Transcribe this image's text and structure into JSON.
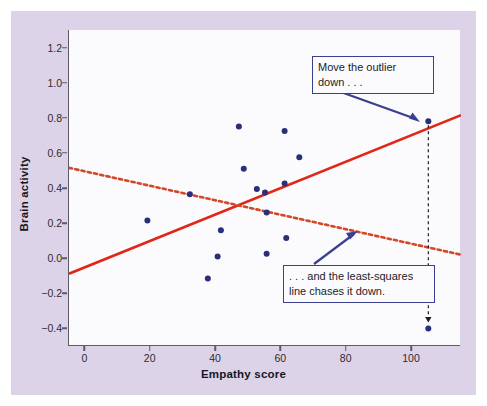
{
  "figure": {
    "panel_bg": "#ddd3e8",
    "plot_bg": "#fbfafc",
    "point_color": "#2b2f7a",
    "solid_line_color": "#e02717",
    "dotted_line_color": "#d1482a",
    "callout_border": "#3a3f8f",
    "arrow_color": "#3a3f8f",
    "drop_line_color": "#1d1d28"
  },
  "annotations": {
    "outlier_note": "Move the outlier\ndown . . .",
    "least_squares_note": ". . . and the least-squares\nline chases it down."
  },
  "chart_data": {
    "type": "scatter",
    "title": "",
    "xlabel": "Empathy score",
    "ylabel": "Brain activity",
    "xlim": [
      -5,
      115
    ],
    "ylim": [
      -0.5,
      1.3
    ],
    "xticks": [
      0,
      20,
      40,
      60,
      80,
      100
    ],
    "xtick_labels": [
      "0",
      "20",
      "40",
      "60",
      "80",
      "100"
    ],
    "yticks": [
      1.2,
      1.0,
      0.8,
      0.6,
      0.4,
      0.2,
      0.0,
      -0.2,
      -0.4
    ],
    "ytick_labels": [
      "1.2",
      "1.0",
      "0.8",
      "0.6",
      "0.4",
      "0.2",
      "0.0",
      "-0.2",
      "-0.4"
    ],
    "grid": false,
    "legend": null,
    "points": [
      {
        "x": 19,
        "y": 0.215
      },
      {
        "x": 32,
        "y": 0.365
      },
      {
        "x": 37.5,
        "y": -0.115
      },
      {
        "x": 40.5,
        "y": 0.01
      },
      {
        "x": 41.5,
        "y": 0.16
      },
      {
        "x": 47,
        "y": 0.75
      },
      {
        "x": 48.5,
        "y": 0.51
      },
      {
        "x": 52.5,
        "y": 0.395
      },
      {
        "x": 55,
        "y": 0.375
      },
      {
        "x": 55.5,
        "y": 0.26
      },
      {
        "x": 55.5,
        "y": 0.025
      },
      {
        "x": 61,
        "y": 0.725
      },
      {
        "x": 61,
        "y": 0.425
      },
      {
        "x": 61.5,
        "y": 0.115
      },
      {
        "x": 65.5,
        "y": 0.575
      },
      {
        "x": 105,
        "y": 0.78
      },
      {
        "x": 105,
        "y": -0.4
      }
    ],
    "series": [
      {
        "name": "least-squares line with outlier high",
        "type": "line",
        "style": "solid",
        "color": "#e02717",
        "endpoints": [
          {
            "x": -5,
            "y": -0.088
          },
          {
            "x": 115,
            "y": 0.815
          }
        ]
      },
      {
        "name": "least-squares line after outlier moved down",
        "type": "line",
        "style": "dotted",
        "color": "#d1482a",
        "endpoints": [
          {
            "x": -5,
            "y": 0.515
          },
          {
            "x": 115,
            "y": 0.02
          }
        ]
      }
    ],
    "outlier": {
      "original": {
        "x": 105,
        "y": 0.78
      },
      "moved": {
        "x": 105,
        "y": -0.4
      },
      "drop_line_style": "dashed"
    }
  }
}
